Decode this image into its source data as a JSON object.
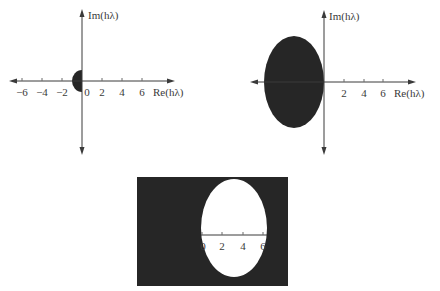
{
  "figure": {
    "colors": {
      "region_fill": "#262626",
      "axis": "#3a3a3a",
      "background": "#ffffff"
    },
    "panels": [
      {
        "id": "panel-a",
        "x_axis_label": "Re(hλ)",
        "y_axis_label": "Im(hλ)",
        "x_tick_labels": [
          "−6",
          "−4",
          "−2",
          "0",
          "2",
          "4",
          "6"
        ],
        "region": {
          "shape": "half-disk",
          "side": "left of origin",
          "center": [
            0,
            0
          ],
          "radius": 1,
          "shaded": "inside"
        }
      },
      {
        "id": "panel-b",
        "x_axis_label": "Re(hλ)",
        "y_axis_label": "Im(hλ)",
        "x_tick_labels": [
          "2",
          "4",
          "6"
        ],
        "region": {
          "shape": "ellipse",
          "center_re": -3,
          "semi_axis_re": 3,
          "semi_axis_im": 4.5,
          "shaded": "inside"
        }
      },
      {
        "id": "panel-c",
        "x_tick_labels": [
          "0",
          "2",
          "4",
          "6"
        ],
        "region": {
          "shape": "ellipse",
          "center_re": 3,
          "semi_axis_re": 3,
          "semi_axis_im": 5,
          "shaded": "outside"
        }
      }
    ]
  }
}
